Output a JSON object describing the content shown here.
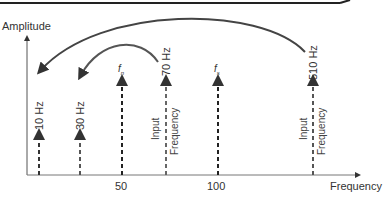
{
  "diagram": {
    "y_axis_label": "Amplitude",
    "x_axis_label": "Frequency",
    "x_ticks": [
      "50",
      "100"
    ],
    "lines": [
      {
        "label": "10 Hz",
        "type": "alias",
        "x": 38
      },
      {
        "label": "30 Hz",
        "type": "alias",
        "x": 79
      },
      {
        "label": "f",
        "sub": "n",
        "type": "nyquist",
        "x": 121
      },
      {
        "label": "70 Hz",
        "type": "input",
        "x": 165,
        "caption_line1": "Input",
        "caption_line2": "Frequency"
      },
      {
        "label": "f",
        "sub": "s",
        "type": "sampling",
        "x": 218
      },
      {
        "label": "510 Hz",
        "type": "input",
        "x": 313,
        "caption_line1": "Input",
        "caption_line2": "Frequency"
      }
    ],
    "arcs": [
      {
        "from": "510 Hz",
        "to": "10 Hz"
      },
      {
        "from": "70 Hz",
        "to": "30 Hz"
      }
    ]
  }
}
